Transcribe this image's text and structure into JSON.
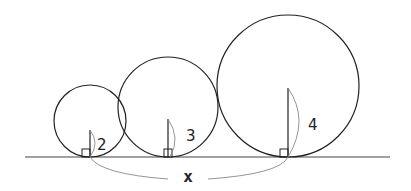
{
  "diagram": {
    "baseline": {
      "x1": 25,
      "x2": 390,
      "y": 157
    },
    "circles": [
      {
        "id": "small",
        "cx": 90,
        "cy": 121,
        "r": 36,
        "label": "2"
      },
      {
        "id": "medium",
        "cx": 168,
        "cy": 107,
        "r": 50,
        "label": "3"
      },
      {
        "id": "large",
        "cx": 288,
        "cy": 86,
        "r": 71,
        "label": "4"
      }
    ],
    "span_label": "x",
    "colors": {
      "stroke": "#222222",
      "arc": "#888888"
    }
  }
}
